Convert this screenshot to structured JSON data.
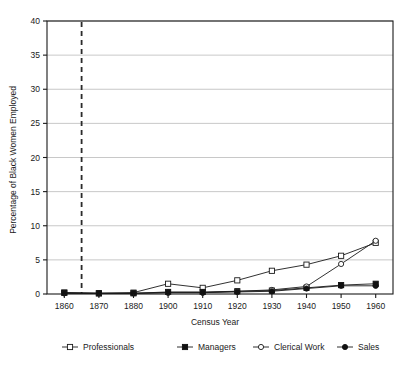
{
  "chart_data": {
    "type": "line",
    "title": "",
    "xlabel": "Census Year",
    "ylabel": "Percentage of Black Women Employed",
    "categories": [
      "1860",
      "1870",
      "1880",
      "1900",
      "1910",
      "1920",
      "1930",
      "1940",
      "1950",
      "1960"
    ],
    "ylim": [
      0,
      40
    ],
    "ytick_values": [
      0,
      5,
      10,
      15,
      20,
      25,
      30,
      35,
      40
    ],
    "ytick_labels": [
      "0",
      "5",
      "10",
      "15",
      "20",
      "25",
      "30",
      "35",
      "40"
    ],
    "grid": "horizontal",
    "legend_position": "bottom",
    "series": [
      {
        "name": "Professionals",
        "marker": "open-square",
        "values": [
          0.2,
          0.1,
          0.2,
          1.5,
          0.9,
          2.0,
          3.4,
          4.3,
          5.6,
          7.5
        ]
      },
      {
        "name": "Managers",
        "marker": "filled-square",
        "values": [
          0.2,
          0.1,
          0.1,
          0.3,
          0.3,
          0.4,
          0.5,
          0.9,
          1.3,
          1.5
        ]
      },
      {
        "name": "Clerical Work",
        "marker": "open-circle",
        "values": [
          0.1,
          0.1,
          0.1,
          0.2,
          0.2,
          0.4,
          0.6,
          1.1,
          4.4,
          7.8
        ]
      },
      {
        "name": "Sales",
        "marker": "filled-circle",
        "values": [
          0.1,
          0.1,
          0.1,
          0.2,
          0.2,
          0.3,
          0.4,
          0.8,
          1.2,
          1.2
        ]
      }
    ],
    "annotations": [
      {
        "type": "vertical-dashed-line",
        "x_value": 1865,
        "label": ""
      }
    ]
  },
  "legend": {
    "items": [
      {
        "label": "Professionals"
      },
      {
        "label": "Managers"
      },
      {
        "label": "Clerical Work"
      },
      {
        "label": "Sales"
      }
    ]
  },
  "axes": {
    "x_title": "Census Year",
    "y_title": "Percentage of Black Women Employed"
  },
  "colors": {
    "ink": "#1a1a1a",
    "grid": "#b0b0b0",
    "background": "#ffffff",
    "marker_fill": "#111111",
    "marker_open": "#ffffff"
  }
}
